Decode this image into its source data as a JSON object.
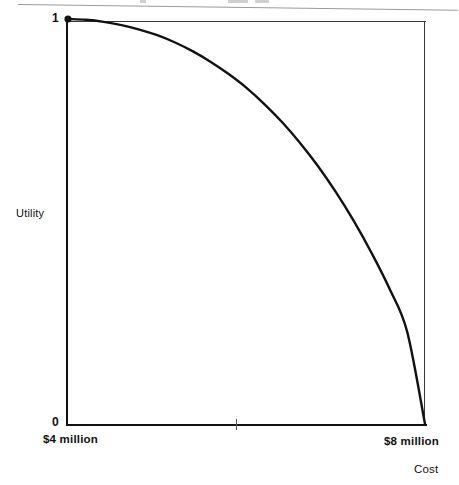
{
  "figure": {
    "background_color": "#ffffff",
    "ink_color": "#121212"
  },
  "labels": {
    "y_axis_title": "Utility",
    "y_max": "1",
    "y_min": "0",
    "x_min": "$4 million",
    "x_max": "$8 million",
    "x_axis_title": "Cost"
  },
  "chart_data": {
    "type": "line",
    "title": "",
    "xlabel": "Cost",
    "ylabel": "Utility",
    "xlim": [
      4,
      8
    ],
    "ylim": [
      0,
      1
    ],
    "xtick_labels": [
      "$4 million",
      "$8 million"
    ],
    "ytick_labels": [
      "0",
      "1"
    ],
    "grid": false,
    "legend": "none",
    "markers": [
      {
        "x": 4,
        "y": 1,
        "label": "",
        "style": "filled-dot"
      }
    ],
    "series": [
      {
        "name": "Utility of cost",
        "x": [
          4.0,
          4.2,
          4.4,
          4.6,
          4.8,
          5.0,
          5.2,
          5.4,
          5.6,
          5.8,
          6.0,
          6.2,
          6.4,
          6.6,
          6.8,
          7.0,
          7.2,
          7.4,
          7.6,
          7.8,
          8.0
        ],
        "y": [
          1.0,
          0.998,
          0.993,
          0.985,
          0.974,
          0.96,
          0.942,
          0.92,
          0.894,
          0.864,
          0.83,
          0.79,
          0.745,
          0.694,
          0.637,
          0.573,
          0.502,
          0.423,
          0.335,
          0.228,
          0.0
        ]
      }
    ]
  }
}
